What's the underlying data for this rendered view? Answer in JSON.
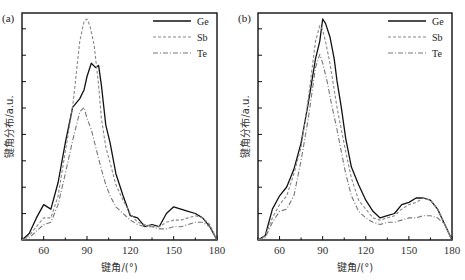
{
  "chart_data": [
    {
      "panel": "(a)",
      "type": "line",
      "title": "",
      "xlabel": "键角/(°)",
      "ylabel": "键角分布/a.u.",
      "xlim": [
        45,
        180
      ],
      "ylim": [
        0,
        1
      ],
      "xticks": [
        60,
        90,
        120,
        150,
        180
      ],
      "grid": false,
      "legend_position": "upper right",
      "series": [
        {
          "name": "Ge",
          "style": "solid",
          "x": [
            45,
            50,
            55,
            60,
            65,
            70,
            75,
            80,
            85,
            88,
            90,
            93,
            96,
            98,
            100,
            103,
            106,
            110,
            115,
            120,
            125,
            130,
            135,
            140,
            145,
            150,
            155,
            160,
            165,
            170,
            175,
            180
          ],
          "y": [
            0.0,
            0.03,
            0.1,
            0.16,
            0.14,
            0.26,
            0.44,
            0.6,
            0.64,
            0.68,
            0.74,
            0.8,
            0.78,
            0.79,
            0.7,
            0.52,
            0.44,
            0.3,
            0.2,
            0.11,
            0.1,
            0.06,
            0.07,
            0.06,
            0.12,
            0.15,
            0.14,
            0.13,
            0.12,
            0.1,
            0.06,
            0.0
          ]
        },
        {
          "name": "Sb",
          "style": "dashed",
          "x": [
            45,
            50,
            55,
            60,
            65,
            70,
            75,
            80,
            85,
            88,
            90,
            92,
            95,
            98,
            100,
            103,
            106,
            110,
            115,
            120,
            125,
            130,
            135,
            140,
            145,
            150,
            155,
            160,
            165,
            170,
            175,
            180
          ],
          "y": [
            0.0,
            0.02,
            0.06,
            0.1,
            0.1,
            0.2,
            0.4,
            0.6,
            0.9,
            0.99,
            1.0,
            0.97,
            0.88,
            0.7,
            0.55,
            0.42,
            0.35,
            0.25,
            0.18,
            0.12,
            0.08,
            0.07,
            0.06,
            0.06,
            0.08,
            0.09,
            0.09,
            0.1,
            0.11,
            0.1,
            0.07,
            0.0
          ]
        },
        {
          "name": "Te",
          "style": "dash-dot",
          "x": [
            45,
            50,
            55,
            60,
            65,
            70,
            75,
            80,
            85,
            88,
            90,
            93,
            96,
            100,
            103,
            106,
            110,
            115,
            120,
            125,
            130,
            135,
            140,
            145,
            150,
            155,
            160,
            165,
            170,
            175,
            180
          ],
          "y": [
            0.0,
            0.01,
            0.04,
            0.07,
            0.08,
            0.16,
            0.3,
            0.45,
            0.58,
            0.6,
            0.55,
            0.5,
            0.42,
            0.32,
            0.25,
            0.2,
            0.15,
            0.12,
            0.09,
            0.07,
            0.06,
            0.06,
            0.05,
            0.05,
            0.06,
            0.06,
            0.07,
            0.08,
            0.08,
            0.06,
            0.0
          ]
        }
      ]
    },
    {
      "panel": "(b)",
      "type": "line",
      "title": "",
      "xlabel": "键角/(°)",
      "ylabel": "键角分布/a.u.",
      "xlim": [
        45,
        180
      ],
      "ylim": [
        0,
        1
      ],
      "xticks": [
        60,
        90,
        120,
        150,
        180
      ],
      "grid": false,
      "legend_position": "upper right",
      "series": [
        {
          "name": "Ge",
          "style": "solid",
          "x": [
            45,
            50,
            55,
            60,
            65,
            70,
            75,
            80,
            85,
            88,
            90,
            92,
            95,
            98,
            100,
            103,
            106,
            110,
            115,
            120,
            125,
            130,
            135,
            140,
            145,
            150,
            155,
            160,
            165,
            170,
            175,
            180
          ],
          "y": [
            0.0,
            0.02,
            0.14,
            0.2,
            0.24,
            0.32,
            0.44,
            0.62,
            0.82,
            0.9,
            1.0,
            0.98,
            0.92,
            0.82,
            0.72,
            0.6,
            0.46,
            0.33,
            0.25,
            0.18,
            0.13,
            0.1,
            0.11,
            0.12,
            0.16,
            0.17,
            0.19,
            0.19,
            0.18,
            0.14,
            0.07,
            0.0
          ]
        },
        {
          "name": "Sb",
          "style": "dashed",
          "x": [
            45,
            50,
            55,
            60,
            65,
            70,
            75,
            80,
            85,
            88,
            90,
            92,
            95,
            98,
            100,
            103,
            106,
            110,
            115,
            120,
            125,
            130,
            135,
            140,
            145,
            150,
            155,
            160,
            165,
            170,
            175,
            180
          ],
          "y": [
            0.0,
            0.02,
            0.1,
            0.16,
            0.2,
            0.3,
            0.42,
            0.64,
            0.9,
            0.97,
            0.95,
            0.9,
            0.8,
            0.68,
            0.6,
            0.5,
            0.4,
            0.28,
            0.18,
            0.14,
            0.1,
            0.09,
            0.1,
            0.11,
            0.14,
            0.16,
            0.17,
            0.19,
            0.18,
            0.14,
            0.07,
            0.0
          ]
        },
        {
          "name": "Te",
          "style": "dash-dot",
          "x": [
            45,
            50,
            55,
            60,
            65,
            70,
            75,
            80,
            85,
            88,
            90,
            93,
            96,
            100,
            103,
            106,
            110,
            115,
            120,
            125,
            130,
            135,
            140,
            145,
            150,
            155,
            160,
            165,
            170,
            175,
            180
          ],
          "y": [
            0.0,
            0.01,
            0.08,
            0.13,
            0.14,
            0.2,
            0.36,
            0.55,
            0.78,
            0.84,
            0.8,
            0.72,
            0.62,
            0.5,
            0.4,
            0.3,
            0.2,
            0.13,
            0.1,
            0.08,
            0.07,
            0.08,
            0.08,
            0.09,
            0.1,
            0.1,
            0.11,
            0.11,
            0.1,
            0.07,
            0.0
          ]
        }
      ]
    }
  ]
}
